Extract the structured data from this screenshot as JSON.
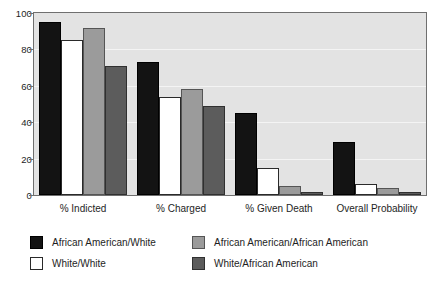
{
  "chart_data": {
    "type": "bar",
    "title": "",
    "subtitle": "",
    "xlabel": "",
    "ylabel": "",
    "ylim": [
      0,
      100
    ],
    "yticks": [
      0,
      20,
      40,
      60,
      80,
      100
    ],
    "grid": true,
    "legend_position": "bottom",
    "categories": [
      "% Indicted",
      "% Charged",
      "% Given Death",
      "Overall Probability"
    ],
    "series": [
      {
        "name": "African American/White",
        "color": "#131313",
        "values": [
          95,
          73,
          45,
          29
        ]
      },
      {
        "name": "White/White",
        "color": "#ffffff",
        "values": [
          85,
          54,
          15,
          6
        ]
      },
      {
        "name": "African American/African American",
        "color": "#9b9b9b",
        "values": [
          92,
          58,
          5,
          4
        ]
      },
      {
        "name": "White/African American",
        "color": "#5c5c5c",
        "values": [
          71,
          49,
          1.5,
          1.5
        ]
      }
    ]
  },
  "legend": {
    "entries": [
      {
        "label": "African American/White"
      },
      {
        "label": "White/White"
      },
      {
        "label": "African American/African American"
      },
      {
        "label": "White/African American"
      }
    ]
  },
  "colors": {
    "plot_background": "#e3e3e3",
    "gridline": "#f4f4f4",
    "axis": "#6f6f6f",
    "text": "#1e1e1e",
    "page_background": "#ffffff"
  }
}
